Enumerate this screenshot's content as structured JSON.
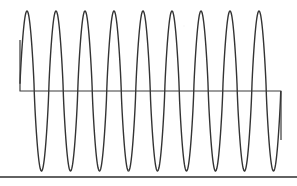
{
  "figure": {
    "title": "",
    "caption": "Oscilloscope-style sinusoidal waveform trace with horizontal baseline",
    "background_color": "#ffffff",
    "trace_color": "#333333",
    "baseline_color": "#3a3a3a",
    "border_color": "#2e2e2e"
  },
  "chart_data": {
    "type": "line",
    "title": "",
    "xlabel": "",
    "ylabel": "",
    "grid": false,
    "legend_position": "none",
    "xlim": [
      0,
      297
    ],
    "ylim": [
      186,
      0
    ],
    "axis_ticks_visible": false,
    "tick_labels_x": [],
    "tick_labels_y": [],
    "series": [
      {
        "name": "sine-wave-trace",
        "color": "#333333",
        "stroke_width": 1.4,
        "cycles": 9,
        "period_px": 29,
        "amplitude_px": 80,
        "peak_y_px": 11,
        "trough_y_px": 171,
        "center_y_px": 91,
        "x_start_px": 20,
        "x_end_px": 281,
        "first_peak_x_px": 27,
        "peak_x_positions": [
          27,
          56,
          85,
          114,
          143,
          172,
          201,
          230,
          259
        ],
        "trough_x_positions": [
          41,
          70,
          99,
          128,
          157,
          186,
          215,
          244,
          273
        ]
      },
      {
        "name": "baseline-overlay",
        "color": "#3a3a3a",
        "stroke_width": 1.2,
        "y_px": 91,
        "x_start_px": 20,
        "x_end_px": 281,
        "left_riser_top_y_px": 40,
        "right_drop_bottom_y_px": 140
      },
      {
        "name": "bottom-border-rule",
        "color": "#2e2e2e",
        "stroke_width": 1.6,
        "y_px": 177,
        "x_start_px": 0,
        "x_end_px": 297
      }
    ]
  }
}
